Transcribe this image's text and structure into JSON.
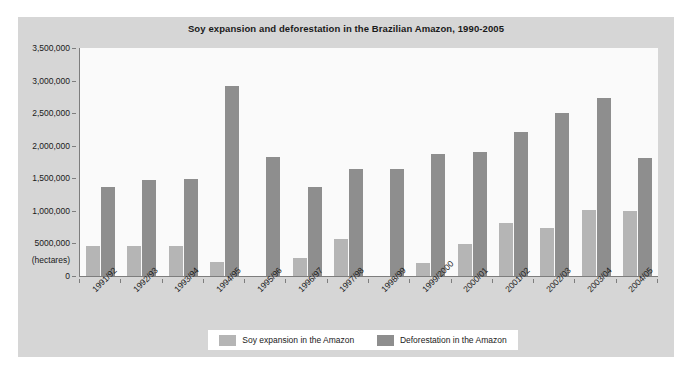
{
  "chart_data": {
    "type": "bar",
    "title": "Soy expansion and deforestation in the Brazilian Amazon, 1990-2005",
    "xlabel": "",
    "ylabel": "(hectares)",
    "ylim": [
      0,
      3500000
    ],
    "grid": false,
    "legend_position": "bottom",
    "y_tick_labels": [
      "3,500,000",
      "3,000,000",
      "2,500,000",
      "2,000,000",
      "1,500,000",
      "1,000,000",
      "5000,000",
      "(hectares)",
      "0"
    ],
    "y_tick_values": [
      3500000,
      3000000,
      2500000,
      2000000,
      1500000,
      1000000,
      500000,
      null,
      0
    ],
    "categories": [
      "1991/92",
      "1992/93",
      "1993/94",
      "1994/95",
      "1995/96",
      "1996/97",
      "1997/98",
      "1998/99",
      "1999/2000",
      "2000/01",
      "2001/02",
      "2002/03",
      "2003/04",
      "2004/05"
    ],
    "series": [
      {
        "name": "Soy expansion in the Amazon",
        "color": "#b5b5b5",
        "values": [
          460000,
          460000,
          460000,
          210000,
          0,
          280000,
          570000,
          0,
          200000,
          490000,
          820000,
          730000,
          1020000,
          1000000
        ]
      },
      {
        "name": "Deforestation in the Amazon",
        "color": "#8e8e8e",
        "values": [
          1360000,
          1480000,
          1490000,
          2920000,
          1830000,
          1370000,
          1640000,
          1640000,
          1880000,
          1900000,
          2210000,
          2500000,
          2730000,
          1810000
        ]
      }
    ]
  },
  "legend": {
    "items": [
      {
        "label": "Soy expansion in the Amazon",
        "color": "#b5b5b5"
      },
      {
        "label": "Deforestation in the Amazon",
        "color": "#8e8e8e"
      }
    ]
  },
  "colors": {
    "frame_background": "#d6d6d6",
    "plot_background": "#fafafa",
    "axis_line": "#7d7d7d",
    "text": "#1a1a1a"
  }
}
